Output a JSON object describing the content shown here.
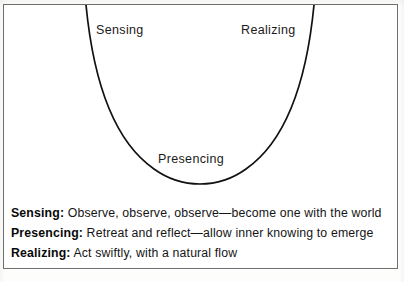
{
  "diagram": {
    "type": "u-curve",
    "stroke_color": "#111111",
    "background_color": "#ffffff",
    "frame_color": "#6e6e6e",
    "labels": {
      "left": "Sensing",
      "right": "Realizing",
      "bottom": "Presencing"
    },
    "curve_points": {
      "left_top": [
        85,
        5
      ],
      "left_mid": [
        95,
        100
      ],
      "bottom": [
        198,
        179
      ],
      "right_mid": [
        300,
        100
      ],
      "right_top": [
        312,
        5
      ]
    }
  },
  "legend": {
    "items": [
      {
        "term": "Sensing:",
        "description": " Observe, observe, observe—become one with the world"
      },
      {
        "term": "Presencing:",
        "description": " Retreat and reflect—allow inner knowing to emerge"
      },
      {
        "term": "Realizing:",
        "description": " Act swiftly, with a natural flow"
      }
    ]
  }
}
